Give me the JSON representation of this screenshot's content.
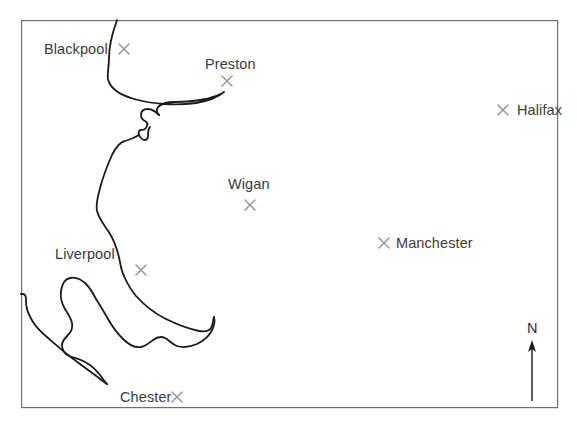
{
  "map": {
    "title": "North West England coastline map",
    "background_color": "#ffffff",
    "frame": {
      "color": "#6e6e6e",
      "stroke_width": 1.2,
      "x": 21,
      "y": 20,
      "width": 537,
      "height": 388
    },
    "coastline": {
      "color": "#1a1a1a",
      "stroke_width": 1.8
    },
    "marker": {
      "glyph": "cross-x",
      "color": "#9a9a9a",
      "size": 11,
      "stroke_width": 1.6
    },
    "cities": [
      {
        "name": "Blackpool",
        "label_x": 44,
        "label_y": 42,
        "marker_x": 124,
        "marker_y": 49,
        "label_side": "left"
      },
      {
        "name": "Preston",
        "label_x": 205,
        "label_y": 57,
        "marker_x": 227,
        "marker_y": 81,
        "label_side": "above"
      },
      {
        "name": "Halifax",
        "label_x": 517,
        "label_y": 103,
        "marker_x": 503,
        "marker_y": 110,
        "label_side": "right"
      },
      {
        "name": "Wigan",
        "label_x": 228,
        "label_y": 177,
        "marker_x": 250,
        "marker_y": 205,
        "label_side": "above"
      },
      {
        "name": "Manchester",
        "label_x": 396,
        "label_y": 236,
        "marker_x": 384,
        "marker_y": 243,
        "label_side": "right"
      },
      {
        "name": "Liverpool",
        "label_x": 55,
        "label_y": 247,
        "marker_x": 141,
        "marker_y": 270,
        "label_side": "left"
      },
      {
        "name": "Chester",
        "label_x": 120,
        "label_y": 390,
        "marker_x": 177,
        "marker_y": 397,
        "label_side": "left"
      }
    ],
    "compass": {
      "label": "N",
      "label_x": 527,
      "label_y": 321,
      "arrow_color": "#1a1a1a",
      "arrow_x": 532,
      "arrow_tip_y": 343,
      "arrow_tail_y": 401
    }
  }
}
